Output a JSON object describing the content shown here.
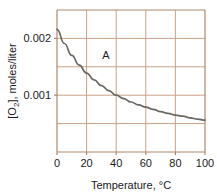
{
  "chart_data": {
    "type": "line",
    "title": "",
    "xlabel": "Temperature, °C",
    "ylabel_prefix": "[O",
    "ylabel_sub": "2",
    "ylabel_suffix": "], moles/liter",
    "ylabel_plain": "[O2], moles/liter",
    "xlim": [
      0,
      100
    ],
    "ylim": [
      0,
      0.0025
    ],
    "grid": true,
    "legend": "none",
    "x_ticks": [
      0,
      20,
      40,
      60,
      80,
      100
    ],
    "x_tick_labels": [
      "0",
      "20",
      "40",
      "60",
      "80",
      "100"
    ],
    "y_ticks": [
      0.001,
      0.002
    ],
    "y_tick_labels": [
      "0.001",
      "0.002"
    ],
    "y_gridlines": [
      0.0005,
      0.001,
      0.0015,
      0.002
    ],
    "x_gridlines": [
      0,
      20,
      40,
      60,
      80,
      100
    ],
    "annotations": [
      {
        "text": "A",
        "x": 33,
        "y": 0.00163
      }
    ],
    "series": [
      {
        "name": "O2 solubility",
        "color": "#6b6660",
        "x": [
          0,
          5,
          10,
          15,
          20,
          25,
          30,
          35,
          40,
          45,
          50,
          55,
          60,
          65,
          70,
          75,
          80,
          85,
          90,
          95,
          100
        ],
        "values": [
          0.00216,
          0.00191,
          0.0017,
          0.00153,
          0.00139,
          0.00127,
          0.00117,
          0.00108,
          0.001,
          0.00094,
          0.00088,
          0.00083,
          0.00079,
          0.00075,
          0.00071,
          0.00068,
          0.00065,
          0.00063,
          0.0006,
          0.00058,
          0.00056
        ]
      }
    ],
    "colors": {
      "grid": "#c9a186",
      "axis": "#b08868",
      "curve": "#6b6660",
      "text": "#1a1a1a",
      "background": "#ffffff"
    }
  }
}
